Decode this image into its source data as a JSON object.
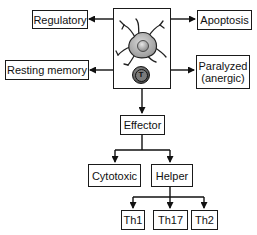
{
  "diagram": {
    "center": {
      "label": "",
      "icons": [
        "dendritic-cell-icon",
        "t-cell-icon"
      ],
      "t_cell_glyph": "T"
    },
    "outcomes": {
      "regulatory": "Regulatory",
      "apoptosis": "Apoptosis",
      "resting_memory": "Resting memory",
      "paralyzed_line1": "Paralyzed",
      "paralyzed_line2": "(anergic)",
      "effector": "Effector"
    },
    "effector_children": {
      "cytotoxic": "Cytotoxic",
      "helper": "Helper"
    },
    "helper_children": {
      "th1": "Th1",
      "th17": "Th17",
      "th2": "Th2"
    }
  }
}
